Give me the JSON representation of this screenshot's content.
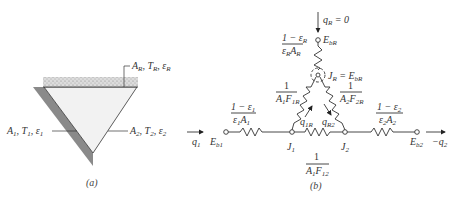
{
  "figure_a": {
    "caption": "(a)",
    "surface_R_label": "A_R, T_R, ε_R",
    "surface_1_label": "A_1, T_1, ε_1",
    "surface_2_label": "A_2, T_2, ε_2",
    "colors": {
      "shadow": "#8a8a8a",
      "insulated_fill": "#d8d8d8",
      "interior": "#f2f2f2"
    }
  },
  "figure_b": {
    "caption": "(b)",
    "qR_label": "q_R = 0",
    "EbR_label": "E_bR",
    "R_surface_resistance": {
      "numerator": "1 − ε_R",
      "denominator": "ε_R A_R"
    },
    "JR_label": "J_R = E_bR",
    "R1R": {
      "numerator": "1",
      "denominator": "A_1F_1R"
    },
    "R2R": {
      "numerator": "1",
      "denominator": "A_2F_2R"
    },
    "R12": {
      "numerator": "1",
      "denominator": "A_1F_12"
    },
    "R1_surface": {
      "numerator": "1 − ε_1",
      "denominator": "ε_1A_1"
    },
    "R2_surface": {
      "numerator": "1 − ε_2",
      "denominator": "ε_2A_2"
    },
    "q1_label": "q_1",
    "q2_label": "−q_2",
    "Eb1_label": "E_b1",
    "Eb2_label": "E_b2",
    "J1_label": "J_1",
    "J2_label": "J_2",
    "q1R_label": "q_1R",
    "qR2_label": "q_R2"
  }
}
